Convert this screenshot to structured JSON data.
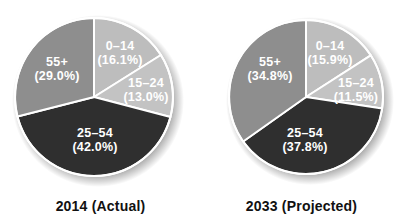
{
  "chart_data": [
    {
      "type": "pie",
      "title": "2014 (Actual)",
      "start_angle": "12 o'clock",
      "direction": "clockwise",
      "categories": [
        "0–14",
        "15–24",
        "25–54",
        "55+"
      ],
      "values": [
        16.1,
        13.0,
        42.0,
        29.0
      ],
      "labels": [
        "(16.1%)",
        "(13.0%)",
        "(42.0%)",
        "(29.0%)"
      ],
      "colors": [
        "#bdbdbd",
        "#c3c3c3",
        "#2f2f2f",
        "#8e8e8e"
      ],
      "legend": "none (inline labels)"
    },
    {
      "type": "pie",
      "title": "2033 (Projected)",
      "start_angle": "12 o'clock",
      "direction": "clockwise",
      "categories": [
        "0–14",
        "15–24",
        "25–54",
        "55+"
      ],
      "values": [
        15.9,
        11.5,
        37.8,
        34.8
      ],
      "labels": [
        "(15.9%)",
        "(11.5%)",
        "(37.8%)",
        "(34.8%)"
      ],
      "colors": [
        "#bdbdbd",
        "#c3c3c3",
        "#2f2f2f",
        "#8e8e8e"
      ],
      "legend": "none (inline labels)"
    }
  ],
  "charts": {
    "left": {
      "title": "2014 (Actual)",
      "slices": [
        {
          "category": "0–14",
          "pct_label": "(16.1%)"
        },
        {
          "category": "15–24",
          "pct_label": "(13.0%)"
        },
        {
          "category": "25–54",
          "pct_label": "(42.0%)"
        },
        {
          "category": "55+",
          "pct_label": "(29.0%)"
        }
      ]
    },
    "right": {
      "title": "2033 (Projected)",
      "slices": [
        {
          "category": "0–14",
          "pct_label": "(15.9%)"
        },
        {
          "category": "15–24",
          "pct_label": "(11.5%)"
        },
        {
          "category": "25–54",
          "pct_label": "(37.8%)"
        },
        {
          "category": "55+",
          "pct_label": "(34.8%)"
        }
      ]
    }
  }
}
